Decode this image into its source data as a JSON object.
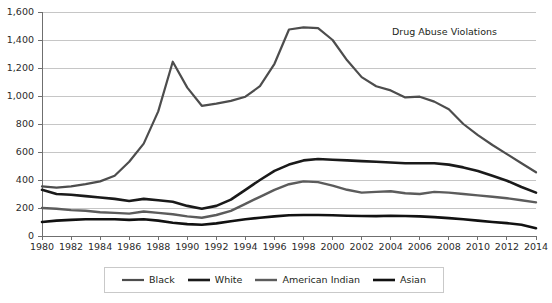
{
  "chart_data": {
    "type": "line",
    "title": "Drug Abuse Violations",
    "xlabel": "",
    "ylabel": "",
    "xlim": [
      1980,
      2014
    ],
    "ylim": [
      0,
      1600
    ],
    "grid": true,
    "legend_position": "bottom",
    "x": [
      1980,
      1981,
      1982,
      1983,
      1984,
      1985,
      1986,
      1987,
      1988,
      1989,
      1990,
      1991,
      1992,
      1993,
      1994,
      1995,
      1996,
      1997,
      1998,
      1999,
      2000,
      2001,
      2002,
      2003,
      2004,
      2005,
      2006,
      2007,
      2008,
      2009,
      2010,
      2011,
      2012,
      2013,
      2014
    ],
    "xticks": [
      "1980",
      "1982",
      "1984",
      "1986",
      "1988",
      "1990",
      "1992",
      "1994",
      "1996",
      "1998",
      "2000",
      "2002",
      "2004",
      "2006",
      "2008",
      "2010",
      "2012",
      "2014"
    ],
    "yticks": [
      "0",
      "200",
      "400",
      "600",
      "800",
      "1,000",
      "1,200",
      "1,400",
      "1,600"
    ],
    "series": [
      {
        "name": "Black",
        "color": "#4d4d4d",
        "width": 2.2,
        "values": [
          355,
          345,
          355,
          370,
          390,
          430,
          530,
          660,
          890,
          1245,
          1060,
          930,
          945,
          965,
          995,
          1070,
          1230,
          1475,
          1490,
          1485,
          1400,
          1255,
          1135,
          1070,
          1040,
          990,
          995,
          960,
          905,
          800,
          720,
          650,
          585,
          520,
          455
        ]
      },
      {
        "name": "White",
        "color": "#1a1a1a",
        "width": 2.6,
        "values": [
          330,
          300,
          295,
          285,
          275,
          265,
          250,
          265,
          255,
          245,
          215,
          195,
          215,
          260,
          330,
          400,
          465,
          510,
          540,
          550,
          545,
          540,
          535,
          530,
          525,
          520,
          520,
          520,
          510,
          490,
          465,
          430,
          395,
          350,
          310
        ]
      },
      {
        "name": "American Indian",
        "color": "#5c5c5c",
        "width": 2.4,
        "values": [
          200,
          195,
          185,
          180,
          170,
          165,
          160,
          175,
          165,
          155,
          140,
          130,
          150,
          180,
          230,
          280,
          330,
          370,
          390,
          385,
          360,
          330,
          310,
          315,
          320,
          305,
          300,
          315,
          310,
          300,
          290,
          280,
          270,
          255,
          240
        ]
      },
      {
        "name": "Asian",
        "color": "#111111",
        "width": 2.6,
        "values": [
          100,
          110,
          115,
          120,
          120,
          120,
          115,
          120,
          110,
          95,
          85,
          80,
          90,
          105,
          120,
          130,
          140,
          148,
          150,
          150,
          148,
          145,
          143,
          142,
          145,
          143,
          140,
          135,
          128,
          120,
          110,
          100,
          92,
          80,
          55
        ]
      }
    ]
  },
  "legend": {
    "entries": [
      {
        "label": "Black"
      },
      {
        "label": "White"
      },
      {
        "label": "American Indian"
      },
      {
        "label": "Asian"
      }
    ]
  }
}
